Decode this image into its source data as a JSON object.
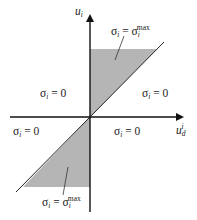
{
  "axes": {
    "y_label": {
      "base": "u",
      "sub": "i"
    },
    "x_label": {
      "base": "u",
      "sub": "d",
      "sup": "i"
    }
  },
  "regions": {
    "upper_shaded": {
      "sigma": "σ",
      "sub": "i",
      "eq": " = ",
      "rhs": "σ",
      "rhs_sub": "i",
      "rhs_sup": "max"
    },
    "lower_shaded": {
      "sigma": "σ",
      "sub": "i",
      "eq": " = ",
      "rhs": "σ",
      "rhs_sub": "i",
      "rhs_sup": "max"
    },
    "upper_left": {
      "sigma": "σ",
      "sub": "i",
      "value": " = 0"
    },
    "upper_right": {
      "sigma": "σ",
      "sub": "i",
      "value": " = 0"
    },
    "lower_left": {
      "sigma": "σ",
      "sub": "i",
      "value": " = 0"
    },
    "lower_right": {
      "sigma": "σ",
      "sub": "i",
      "value": " = 0"
    }
  },
  "colors": {
    "shade": "#b5b5b5",
    "axis": "#111111",
    "text": "#222222"
  }
}
